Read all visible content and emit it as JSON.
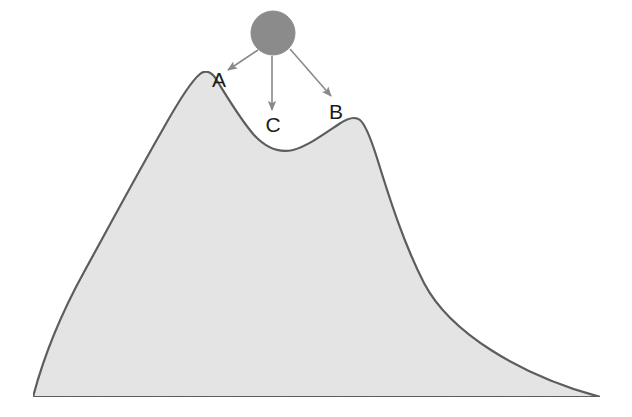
{
  "figure": {
    "canvas": {
      "width": 632,
      "height": 417,
      "background": "#ffffff"
    }
  },
  "terrain": {
    "name": "mountain-silhouette",
    "fill_color": "#e5e5e5",
    "stroke_color": "#575757",
    "stroke_width": 2.2,
    "baseline_y": 397,
    "left_base_x": 33,
    "right_base_x": 600,
    "path": "M 33,397 C 44,355 62,312 84,272 C 106,232 136,176 163,129 C 177,104 190,82 200,74 C 205,70 211,71 216,79 C 226,95 240,119 254,135 C 266,148 280,153 293,150 C 308,146 324,134 339,124 C 348,118 355,116 360,120 C 366,125 371,139 377,158 C 390,200 404,244 424,283 C 450,333 520,375 600,397 Z",
    "peaks": [
      {
        "id": "A",
        "label": "A",
        "role": "left-summit",
        "x": 207,
        "y": 72
      },
      {
        "id": "B",
        "label": "B",
        "role": "right-secondary-summit",
        "x": 358,
        "y": 118
      }
    ],
    "valley": {
      "id": "C",
      "label": "C",
      "role": "saddle-between-peaks",
      "x": 293,
      "y": 150
    }
  },
  "ball": {
    "name": "gray-ball",
    "cx": 273,
    "cy": 33,
    "r": 22,
    "fill_color": "#8b8b8b",
    "stroke_color": "#8b8b8b"
  },
  "arrows": [
    {
      "id": "arrow-to-a",
      "target": "A",
      "color": "#8a8a8a",
      "x1": 258,
      "y1": 50,
      "x2": 228,
      "y2": 70
    },
    {
      "id": "arrow-to-c",
      "target": "C",
      "color": "#8a8a8a",
      "x1": 272,
      "y1": 56,
      "x2": 272,
      "y2": 110
    },
    {
      "id": "arrow-to-b",
      "target": "B",
      "color": "#8a8a8a",
      "x1": 290,
      "y1": 49,
      "x2": 331,
      "y2": 96
    }
  ],
  "labels": {
    "a": {
      "text": "A",
      "x": 219,
      "y": 87,
      "font_size": 21
    },
    "b": {
      "text": "B",
      "x": 336,
      "y": 119,
      "font_size": 21
    },
    "c": {
      "text": "C",
      "x": 273,
      "y": 132,
      "font_size": 21
    }
  },
  "chart_data": {
    "type": "line",
    "xlabel": "",
    "ylabel": "",
    "xlim": [
      0,
      632
    ],
    "ylim": [
      417,
      0
    ],
    "grid": false,
    "legend": "none",
    "series": [
      {
        "name": "terrain-profile",
        "x": [
          33,
          84,
          163,
          200,
          207,
          216,
          254,
          293,
          339,
          358,
          377,
          424,
          500,
          600
        ],
        "y": [
          397,
          272,
          129,
          74,
          72,
          79,
          135,
          150,
          124,
          118,
          158,
          283,
          345,
          397
        ]
      }
    ],
    "annotations": [
      {
        "label": "A",
        "x": 207,
        "y": 72,
        "note": "left summit, arrow target"
      },
      {
        "label": "B",
        "x": 358,
        "y": 118,
        "note": "right secondary summit, arrow target"
      },
      {
        "label": "C",
        "x": 293,
        "y": 150,
        "note": "valley / saddle, arrow target"
      },
      {
        "label": "ball",
        "x": 273,
        "y": 33,
        "note": "gray ball above the ridge, origin of three arrows"
      }
    ]
  }
}
